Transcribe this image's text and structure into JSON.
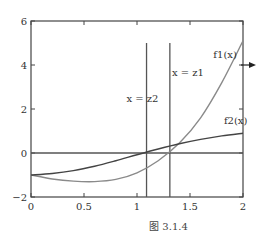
{
  "chart_data": {
    "type": "line",
    "title": "",
    "caption": "图 3.1.4",
    "xlabel": "",
    "ylabel": "",
    "xlim": [
      0,
      2
    ],
    "ylim": [
      -2,
      6
    ],
    "grid": false,
    "x_ticks": [
      0,
      0.5,
      1,
      1.5,
      2
    ],
    "x_tick_labels": [
      "0",
      "0.5",
      "1",
      "1.5",
      "2"
    ],
    "y_ticks": [
      -2,
      0,
      2,
      4,
      6
    ],
    "y_tick_labels": [
      "−2",
      "0",
      "2",
      "4",
      "6"
    ],
    "series": [
      {
        "name": "f1(x)",
        "color": "#8a8a8a",
        "x": [
          0,
          0.2,
          0.4,
          0.6,
          0.8,
          1.0,
          1.2,
          1.4,
          1.6,
          1.8,
          2.0
        ],
        "y": [
          -1.0,
          -1.18,
          -1.28,
          -1.3,
          -1.2,
          -0.9,
          -0.35,
          0.45,
          1.6,
          3.2,
          5.1
        ]
      },
      {
        "name": "f2(x)",
        "color": "#444444",
        "x": [
          0,
          0.2,
          0.4,
          0.6,
          0.8,
          1.0,
          1.2,
          1.4,
          1.6,
          1.8,
          2.0
        ],
        "y": [
          -1.0,
          -0.93,
          -0.8,
          -0.6,
          -0.35,
          -0.08,
          0.18,
          0.42,
          0.62,
          0.78,
          0.9
        ]
      }
    ],
    "reference_lines": {
      "horizontal": [
        {
          "y": 0,
          "color": "#555555"
        }
      ],
      "vertical": [
        {
          "x": 1.31,
          "label": "x = z1",
          "y_top": 5.0
        },
        {
          "x": 1.09,
          "label": "x = z2",
          "y_top": 5.0
        }
      ]
    },
    "annotations": [
      {
        "text": "f1(x)",
        "x": 1.72,
        "y": 4.3
      },
      {
        "text": "f2(x)",
        "x": 1.82,
        "y": 1.3
      },
      {
        "text": "x = z1",
        "x": 1.33,
        "y": 3.5
      },
      {
        "text": "x = z2",
        "x": 0.9,
        "y": 2.3
      },
      {
        "text": "→",
        "x": 2.05,
        "y": 4.0,
        "note": "arrow marker at right axis"
      }
    ]
  },
  "labels": {
    "f1": "f1(x)",
    "f2": "f2(x)",
    "z1": "x = z1",
    "z2": "x = z2",
    "caption": "图 3.1.4"
  }
}
